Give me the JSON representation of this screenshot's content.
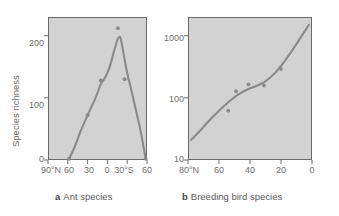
{
  "figure": {
    "background_color": "#ffffff",
    "plot_background_color": "#d2d2d2",
    "line_color": "#8a8a8a",
    "axis_color": "#6a6a6a",
    "text_color": "#6e6e6e"
  },
  "panel_a": {
    "caption_letter": "a",
    "caption_text": "Ant species",
    "ylabel": "Species richness",
    "y_ticks": [
      "0",
      "100",
      "200"
    ],
    "x_ticks": [
      "90°N",
      "60",
      "30",
      "0",
      "30°S",
      "60"
    ]
  },
  "panel_b": {
    "caption_letter": "b",
    "caption_text": "Breeding bird species",
    "y_ticks": [
      "10",
      "100",
      "1000"
    ],
    "x_ticks": [
      "80°N",
      "60",
      "40",
      "20",
      "0"
    ]
  },
  "chart_data": [
    {
      "type": "line",
      "title": "Ant species",
      "panel": "a",
      "xlabel": "Latitude",
      "ylabel": "Species richness",
      "xlim": [
        90,
        -60
      ],
      "ylim": [
        0,
        230
      ],
      "x_tick_values": [
        90,
        60,
        30,
        0,
        -30,
        -60
      ],
      "x_tick_labels": [
        "90°N",
        "60",
        "30",
        "0",
        "30°S",
        "60"
      ],
      "y_tick_values": [
        0,
        100,
        200
      ],
      "y_tick_labels": [
        "0",
        "100",
        "200"
      ],
      "y_scale": "linear",
      "grid": false,
      "legend": "none",
      "series": [
        {
          "name": "Ant species richness curve",
          "x": [
            58,
            50,
            40,
            30,
            20,
            15,
            10,
            5,
            0,
            -5,
            -10,
            -15,
            -18,
            -20,
            -22,
            -25,
            -30,
            -35,
            -40,
            -45,
            -50,
            -55,
            -58
          ],
          "y": [
            2,
            20,
            48,
            72,
            95,
            108,
            122,
            130,
            140,
            155,
            175,
            193,
            198,
            196,
            186,
            168,
            140,
            118,
            95,
            72,
            48,
            20,
            2
          ]
        }
      ],
      "points": [
        {
          "x": 58,
          "y": 2
        },
        {
          "x": 30,
          "y": 72
        },
        {
          "x": 10,
          "y": 128
        },
        {
          "x": -16,
          "y": 212
        },
        {
          "x": -26,
          "y": 130
        },
        {
          "x": -58,
          "y": 2
        }
      ]
    },
    {
      "type": "scatter",
      "title": "Breeding bird species",
      "panel": "b",
      "xlabel": "Latitude",
      "ylabel": "Species richness",
      "xlim": [
        80,
        0
      ],
      "ylim": [
        10,
        2000
      ],
      "x_tick_values": [
        80,
        60,
        40,
        20,
        0
      ],
      "x_tick_labels": [
        "80°N",
        "60",
        "40",
        "20",
        "0"
      ],
      "y_tick_values": [
        10,
        100,
        1000
      ],
      "y_tick_labels": [
        "10",
        "100",
        "1000"
      ],
      "y_scale": "log",
      "grid": false,
      "legend": "none",
      "series": [
        {
          "name": "Breeding bird richness trend",
          "x": [
            78,
            72,
            66,
            60,
            54,
            48,
            42,
            36,
            30,
            24,
            18,
            12,
            6,
            2
          ],
          "y": [
            21,
            30,
            44,
            62,
            85,
            112,
            135,
            155,
            185,
            250,
            380,
            620,
            1050,
            1500
          ]
        }
      ],
      "points": [
        {
          "x": 54,
          "y": 62
        },
        {
          "x": 49,
          "y": 128
        },
        {
          "x": 41,
          "y": 165
        },
        {
          "x": 31,
          "y": 158
        },
        {
          "x": 20,
          "y": 290
        }
      ]
    }
  ]
}
